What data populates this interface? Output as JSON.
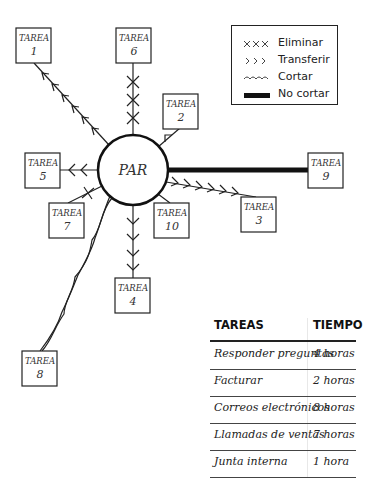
{
  "diagram": {
    "center": {
      "label": "PAR",
      "cx": 133,
      "cy": 170,
      "r": 35
    },
    "tasks": [
      {
        "id": 1,
        "label": "TAREA",
        "number": "1",
        "x": 16,
        "y": 28,
        "relation": "Transferir"
      },
      {
        "id": 2,
        "label": "TAREA",
        "number": "2",
        "x": 163,
        "y": 94,
        "relation": "Transferir"
      },
      {
        "id": 3,
        "label": "TAREA",
        "number": "3",
        "x": 241,
        "y": 197,
        "relation": "Transferir"
      },
      {
        "id": 4,
        "label": "TAREA",
        "number": "4",
        "x": 115,
        "y": 278,
        "relation": "Transferir"
      },
      {
        "id": 5,
        "label": "TAREA",
        "number": "5",
        "x": 25,
        "y": 153,
        "relation": "Transferir"
      },
      {
        "id": 6,
        "label": "TAREA",
        "number": "6",
        "x": 116,
        "y": 28,
        "relation": "Eliminar"
      },
      {
        "id": 7,
        "label": "TAREA",
        "number": "7",
        "x": 49,
        "y": 203,
        "relation": "Eliminar"
      },
      {
        "id": 8,
        "label": "TAREA",
        "number": "8",
        "x": 22,
        "y": 351,
        "relation": "Cortar"
      },
      {
        "id": 9,
        "label": "TAREA",
        "number": "9",
        "x": 308,
        "y": 153,
        "relation": "No cortar"
      },
      {
        "id": 10,
        "label": "TAREA",
        "number": "10",
        "x": 154,
        "y": 203,
        "relation": "Ninguna"
      }
    ]
  },
  "legend": {
    "items": [
      {
        "symbol": "xxx-icon",
        "label": "Eliminar"
      },
      {
        "symbol": "chevrons-icon",
        "label": "Transferir"
      },
      {
        "symbol": "wave-icon",
        "label": "Cortar"
      },
      {
        "symbol": "thick-line-icon",
        "label": "No cortar"
      }
    ]
  },
  "table": {
    "headers": {
      "task": "TAREAS",
      "time": "TIEMPO"
    },
    "rows": [
      {
        "task": "Responder preguntas",
        "time": "4 horas"
      },
      {
        "task": "Facturar",
        "time": "2 horas"
      },
      {
        "task": "Correos electrónicos",
        "time": "8 horas"
      },
      {
        "task": "Llamadas de ventas",
        "time": "7 horas"
      },
      {
        "task": "Junta interna",
        "time": "1 hora"
      }
    ]
  }
}
